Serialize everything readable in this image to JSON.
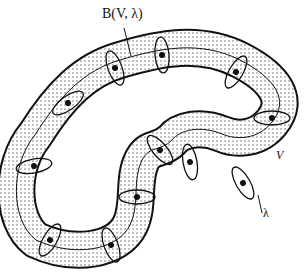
{
  "diagram": {
    "type": "tubular-neighborhood",
    "labels": {
      "neighborhood": "B(V, λ)",
      "curve": "V",
      "radius": "λ"
    },
    "colors": {
      "stroke": "#111111",
      "fill_dots": "#555555",
      "background": "#ffffff"
    },
    "cross_section_points": [
      [
        115,
        68
      ],
      [
        162,
        55
      ],
      [
        236,
        72
      ],
      [
        272,
        118
      ],
      [
        243,
        183
      ],
      [
        190,
        162
      ],
      [
        160,
        150
      ],
      [
        137,
        197
      ],
      [
        111,
        245
      ],
      [
        50,
        240
      ],
      [
        34,
        166
      ],
      [
        68,
        103
      ]
    ]
  }
}
